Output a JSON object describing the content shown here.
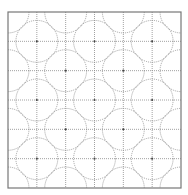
{
  "diagram": {
    "type": "tiled-arc-pattern",
    "frame": {
      "x": 8,
      "y": 12,
      "width": 173,
      "height": 176
    },
    "grid": {
      "columns": 6,
      "rows": 6
    },
    "arc_radius_ratio": 0.72,
    "colors": {
      "background": "#ffffff",
      "frame": "#777777",
      "grid_line": "#8a8a8a",
      "arc_line": "#8a8a8a",
      "node": "#444444"
    }
  }
}
